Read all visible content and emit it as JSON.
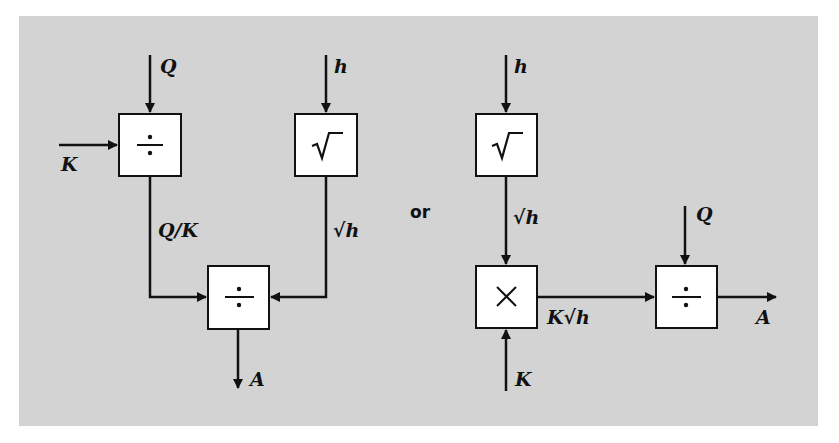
{
  "diagram": {
    "type": "block-diagram",
    "separator_label": "or",
    "colors": {
      "background": "#d3d3d3",
      "box_fill": "#ffffff",
      "stroke": "#111111"
    },
    "left": {
      "blocks": [
        {
          "id": "div1",
          "op": "÷",
          "op_name": "divide"
        },
        {
          "id": "sqrt1",
          "op": "√‾",
          "op_name": "square-root"
        },
        {
          "id": "div2",
          "op": "÷",
          "op_name": "divide"
        }
      ],
      "labels": {
        "input_q": "Q",
        "input_k": "K",
        "input_h": "h",
        "signal_q_over_k": "Q/K",
        "signal_sqrt_h": "√h",
        "output_a": "A"
      }
    },
    "right": {
      "blocks": [
        {
          "id": "sqrt2",
          "op": "√‾",
          "op_name": "square-root"
        },
        {
          "id": "mul",
          "op": "×",
          "op_name": "multiply"
        },
        {
          "id": "div3",
          "op": "÷",
          "op_name": "divide"
        }
      ],
      "labels": {
        "input_h": "h",
        "signal_sqrt_h": "√h",
        "input_k": "K",
        "signal_k_sqrt_h": "K√h",
        "input_q": "Q",
        "output_a": "A"
      }
    }
  }
}
